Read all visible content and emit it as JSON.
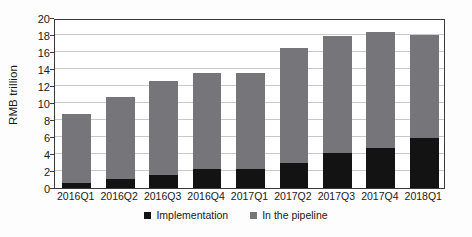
{
  "chart_data": {
    "type": "bar",
    "subtype": "stacked-vertical",
    "title": "",
    "subtitle": "",
    "xlabel": "",
    "ylabel": "RMB trillion",
    "ylim": [
      0,
      20
    ],
    "ytick_step": 2,
    "ytick_labels": [
      "0",
      "2",
      "4",
      "6",
      "8",
      "10",
      "12",
      "14",
      "16",
      "18",
      "20"
    ],
    "ytick_values": [
      0,
      2,
      4,
      6,
      8,
      10,
      12,
      14,
      16,
      18,
      20
    ],
    "grid": "horizontal",
    "legend_position": "bottom-center",
    "categories": [
      "2016Q1",
      "2016Q2",
      "2016Q3",
      "2016Q4",
      "2017Q1",
      "2017Q2",
      "2017Q3",
      "2017Q4",
      "2018Q1"
    ],
    "series": [
      {
        "name": "Implementation",
        "color": "#131313",
        "values": [
          0.5,
          1.0,
          1.5,
          2.2,
          2.2,
          2.9,
          4.1,
          4.6,
          5.8
        ]
      },
      {
        "name": "In the pipeline",
        "color": "#76767a",
        "values": [
          8.2,
          9.6,
          11.0,
          11.3,
          11.3,
          13.5,
          13.7,
          13.7,
          12.1
        ]
      }
    ],
    "totals": [
      8.7,
      10.6,
      12.5,
      13.5,
      13.5,
      16.4,
      17.8,
      18.3,
      17.9
    ]
  },
  "legend": {
    "items": [
      {
        "label": "Implementation",
        "color": "#131313"
      },
      {
        "label": "In the pipeline",
        "color": "#76767a"
      }
    ]
  },
  "colors": {
    "implementation": "#131313",
    "pipeline": "#76767a",
    "gridline": "#c9c9c9",
    "axis": "#3a3a3a",
    "text": "#1a1a1a",
    "background": "#fdfdfd"
  }
}
